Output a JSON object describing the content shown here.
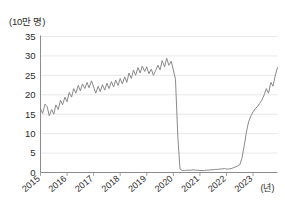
{
  "chart_data": {
    "type": "line",
    "title": "",
    "subtitle": "",
    "ylabel": "(10만 명)",
    "xlabel": "(년)",
    "ylim": [
      0,
      35
    ],
    "xlim": [
      2015.0,
      2023.92
    ],
    "grid": true,
    "legend": false,
    "line_color": "#8a8a8a",
    "y_ticks": [
      0,
      5,
      10,
      15,
      20,
      25,
      30,
      35
    ],
    "y_tick_labels": [
      "0",
      "5",
      "10",
      "15",
      "20",
      "25",
      "30",
      "35"
    ],
    "x_ticks": [
      2015,
      2016,
      2017,
      2018,
      2019,
      2020,
      2021,
      2022,
      2023
    ],
    "x_tick_labels": [
      "2015",
      "2016",
      "2017",
      "2018",
      "2019",
      "2020",
      "2021",
      "2022",
      "2023"
    ],
    "series": [
      {
        "name": "방문객 수",
        "x": [
          2015.0,
          2015.08,
          2015.17,
          2015.25,
          2015.33,
          2015.42,
          2015.5,
          2015.58,
          2015.67,
          2015.75,
          2015.83,
          2015.92,
          2016.0,
          2016.08,
          2016.17,
          2016.25,
          2016.33,
          2016.42,
          2016.5,
          2016.58,
          2016.67,
          2016.75,
          2016.83,
          2016.92,
          2017.0,
          2017.08,
          2017.17,
          2017.25,
          2017.33,
          2017.42,
          2017.5,
          2017.58,
          2017.67,
          2017.75,
          2017.83,
          2017.92,
          2018.0,
          2018.08,
          2018.17,
          2018.25,
          2018.33,
          2018.42,
          2018.5,
          2018.58,
          2018.67,
          2018.75,
          2018.83,
          2018.92,
          2019.0,
          2019.08,
          2019.17,
          2019.25,
          2019.33,
          2019.42,
          2019.5,
          2019.58,
          2019.67,
          2019.75,
          2019.83,
          2019.92,
          2020.0,
          2020.08,
          2020.17,
          2020.25,
          2020.33,
          2020.42,
          2020.5,
          2020.58,
          2020.67,
          2020.75,
          2020.83,
          2020.92,
          2021.0,
          2021.08,
          2021.17,
          2021.25,
          2021.33,
          2021.42,
          2021.5,
          2021.58,
          2021.67,
          2021.75,
          2021.83,
          2021.92,
          2022.0,
          2022.08,
          2022.17,
          2022.25,
          2022.33,
          2022.42,
          2022.5,
          2022.58,
          2022.67,
          2022.75,
          2022.83,
          2022.92,
          2023.0,
          2023.08,
          2023.17,
          2023.25,
          2023.33,
          2023.42,
          2023.5,
          2023.58,
          2023.67,
          2023.75,
          2023.83,
          2023.92
        ],
        "values": [
          16.4,
          15.2,
          17.6,
          17.0,
          14.6,
          16.2,
          15.0,
          17.4,
          16.2,
          18.6,
          17.4,
          19.4,
          18.2,
          20.6,
          19.4,
          21.6,
          20.4,
          22.4,
          21.0,
          22.8,
          21.6,
          23.2,
          21.8,
          23.6,
          22.0,
          20.4,
          22.2,
          20.8,
          22.6,
          21.2,
          23.0,
          21.6,
          23.4,
          22.0,
          23.8,
          22.4,
          24.2,
          22.8,
          24.6,
          23.2,
          25.6,
          24.2,
          26.4,
          25.0,
          27.0,
          25.6,
          27.4,
          26.0,
          27.2,
          25.4,
          26.6,
          25.0,
          26.2,
          27.6,
          26.4,
          28.8,
          27.2,
          29.4,
          27.6,
          28.6,
          26.4,
          24.0,
          9.0,
          0.9,
          0.5,
          0.5,
          0.6,
          0.6,
          0.6,
          0.7,
          0.6,
          0.6,
          0.5,
          0.5,
          0.5,
          0.6,
          0.6,
          0.7,
          0.7,
          0.8,
          0.8,
          0.9,
          0.9,
          1.0,
          0.9,
          0.9,
          1.0,
          1.2,
          1.4,
          1.7,
          2.0,
          3.6,
          7.0,
          10.4,
          13.0,
          14.6,
          15.6,
          16.4,
          17.0,
          17.8,
          18.6,
          20.0,
          21.6,
          20.4,
          23.2,
          22.2,
          24.8,
          27.0
        ]
      }
    ]
  }
}
